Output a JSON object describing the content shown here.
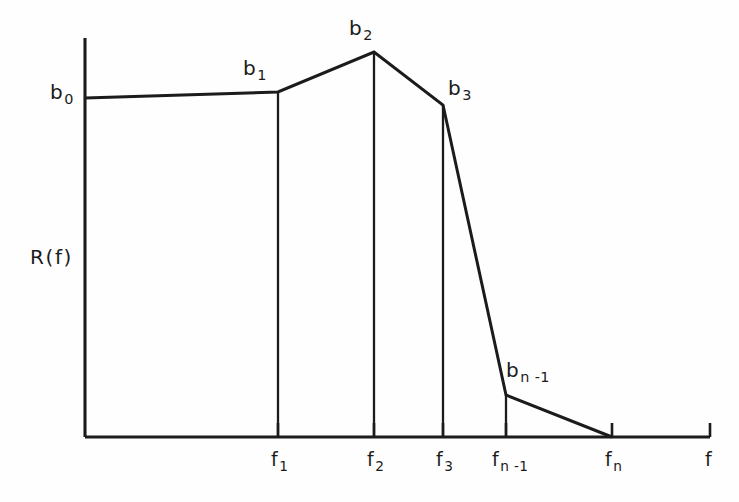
{
  "figure": {
    "y_axis_label": "R(f)",
    "x_axis_variable": "f",
    "breakpoint_labels": {
      "b0": {
        "base": "b",
        "sub": "0"
      },
      "b1": {
        "base": "b",
        "sub": "1"
      },
      "b2": {
        "base": "b",
        "sub": "2"
      },
      "b3": {
        "base": "b",
        "sub": "3"
      },
      "bn1": {
        "base": "b",
        "sub": "n -1"
      }
    },
    "frequency_labels": {
      "f1": {
        "base": "f",
        "sub": "1"
      },
      "f2": {
        "base": "f",
        "sub": "2"
      },
      "f3": {
        "base": "f",
        "sub": "3"
      },
      "fn1": {
        "base": "f",
        "sub": "n -1"
      },
      "fn": {
        "base": "f",
        "sub": "n"
      }
    },
    "ink_color": "#1b1b1b",
    "background_color": "#fefefe"
  },
  "chart_data": {
    "type": "line",
    "title": "",
    "xlabel": "f",
    "ylabel": "R(f)",
    "grid": false,
    "legend": null,
    "x_tick_labels": [
      "f1",
      "f2",
      "f3",
      "fn-1",
      "fn"
    ],
    "x_tick_pixels": [
      278,
      374,
      443,
      506,
      612
    ],
    "axis_origin_pixel": [
      85,
      437
    ],
    "x_axis_end_pixel": [
      710,
      437
    ],
    "y_axis_top_pixel": [
      85,
      38
    ],
    "points": [
      {
        "label": "b0",
        "x_label": "0",
        "x_pixel": 85,
        "y_pixel": 98,
        "value": 0.85
      },
      {
        "label": "b1",
        "x_label": "f1",
        "x_pixel": 278,
        "y_pixel": 92,
        "value": 0.865
      },
      {
        "label": "b2",
        "x_label": "f2",
        "x_pixel": 374,
        "y_pixel": 52,
        "value": 0.965
      },
      {
        "label": "b3",
        "x_label": "f3",
        "x_pixel": 443,
        "y_pixel": 105,
        "value": 0.833
      },
      {
        "label": "bn-1",
        "x_label": "fn-1",
        "x_pixel": 506,
        "y_pixel": 395,
        "value": 0.105
      },
      {
        "label": "0",
        "x_label": "fn",
        "x_pixel": 612,
        "y_pixel": 437,
        "value": 0.0
      }
    ],
    "drop_lines": [
      {
        "at": "f1",
        "x_pixel": 278,
        "y_top_pixel": 92,
        "y_bottom_pixel": 437
      },
      {
        "at": "f2",
        "x_pixel": 374,
        "y_top_pixel": 52,
        "y_bottom_pixel": 437
      },
      {
        "at": "f3",
        "x_pixel": 443,
        "y_top_pixel": 105,
        "y_bottom_pixel": 437
      },
      {
        "at": "fn-1",
        "x_pixel": 506,
        "y_top_pixel": 395,
        "y_bottom_pixel": 437
      }
    ],
    "curve_pixel_path": "M 85 98 L 278 92 L 374 52 L 443 105 L 506 395 L 612 437",
    "ylim": [
      0,
      1
    ],
    "xlim_pixels": [
      85,
      710
    ]
  }
}
